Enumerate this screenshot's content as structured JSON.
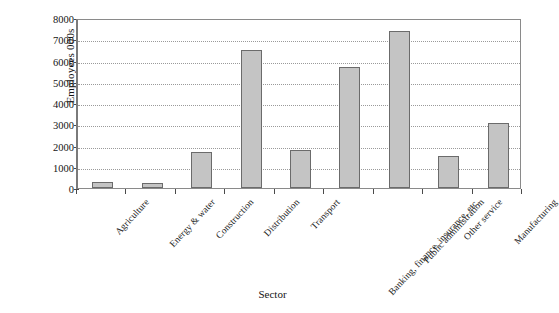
{
  "chart_data": {
    "type": "bar",
    "title": "",
    "xlabel": "Sector",
    "ylabel": "Employees 000s",
    "categories": [
      "Agriculture",
      "Energy & water",
      "Construction",
      "Distribution",
      "Transport",
      "Banking, finance, insurance, etc.",
      "Public administration",
      "Other service",
      "Manufacturing"
    ],
    "values": [
      300,
      250,
      1700,
      6500,
      1800,
      5700,
      7400,
      1500,
      3050
    ],
    "ylim": [
      0,
      8000
    ],
    "ytick_labels": [
      "0",
      "1000",
      "2000",
      "3000",
      "4000",
      "5000",
      "6000",
      "7000",
      "8000"
    ],
    "ytick_values": [
      0,
      1000,
      2000,
      3000,
      4000,
      5000,
      6000,
      7000,
      8000
    ],
    "grid": true,
    "legend": "none",
    "bar_fill_color": "#c4c4c4",
    "bar_edge_color": "#6b6b6b",
    "grid_color": "#9a9a9a",
    "axis_color": "#4a4a4a"
  }
}
